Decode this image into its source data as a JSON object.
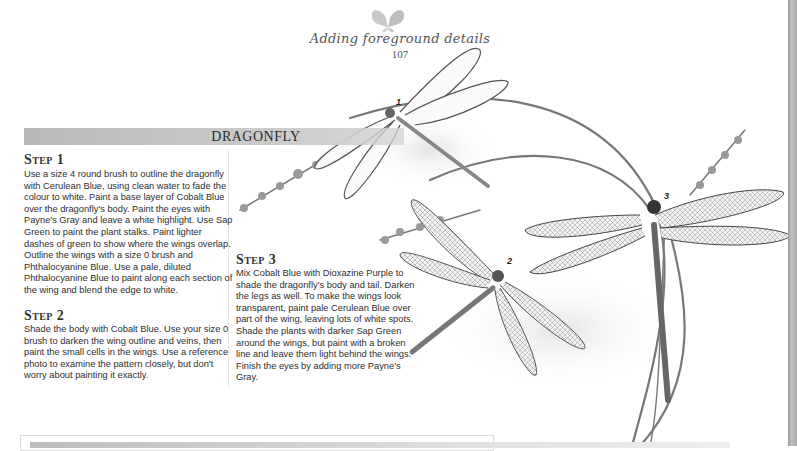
{
  "header": {
    "icon": "butterfly-icon",
    "chapter_title": "Adding foreground details",
    "page_number": "107"
  },
  "section": {
    "title": "DRAGONFLY"
  },
  "steps": [
    {
      "heading": "Step 1",
      "text": "Use a size 4 round brush to outline the dragonfly with Cerulean Blue, using clean water to fade the colour to white. Paint a base layer of Cobalt Blue over the dragonfly's body. Paint the eyes with Payne's Gray and leave a white highlight. Use Sap Green to paint the plant stalks. Paint lighter dashes of green to show where the wings overlap. Outline the wings with a size 0 brush and Phthalocyanine Blue. Use a pale, diluted Phthalocyanine Blue to paint along each section of the wing and blend the edge to white."
    },
    {
      "heading": "Step 2",
      "text": "Shade the body with Cobalt Blue. Use your size 0 brush to darken the wing outline and veins, then paint the small cells in the wings. Use a reference photo to examine the pattern closely, but don't worry about painting it exactly."
    },
    {
      "heading": "Step 3",
      "text": "Mix Cobalt Blue with Dioxazine Purple to shade the dragonfly's body and tail. Darken the legs as well. To make the wings look transparent, paint pale Cerulean Blue over part of the wing, leaving lots of white spots. Shade the plants with darker Sap Green around the wings, but paint with a broken line and leave them light behind the wings. Finish the eyes by adding more Payne's Gray."
    }
  ],
  "illustration": {
    "subject": "three dragonflies on plant stalks",
    "markers": [
      "1",
      "2",
      "3"
    ]
  },
  "colors": {
    "banner": "#c4c4c4",
    "text": "#2e2e2e",
    "heading": "#333333"
  }
}
